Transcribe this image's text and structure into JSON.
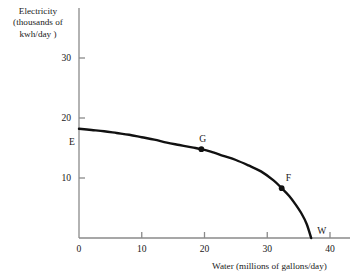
{
  "chart_data": {
    "type": "line",
    "title": "",
    "xlabel": "Water (millions of gallons/day)",
    "ylabel": "Electricity (thousands of kwh/day)",
    "ylabel_lines": [
      "Electricity",
      "(thousands of",
      "kwh/day )"
    ],
    "xlim": [
      0,
      42.6
    ],
    "ylim": [
      0,
      35.6
    ],
    "grid": false,
    "legend": "none",
    "xticks": [
      0,
      10,
      20,
      30,
      40
    ],
    "xtick_labels": [
      "0",
      "10",
      "20",
      "30",
      "40"
    ],
    "yticks": [
      10,
      20,
      30
    ],
    "ytick_labels": [
      "10",
      "20",
      "30"
    ],
    "series": [
      {
        "name": "production-possibilities-frontier",
        "x": [
          0,
          2,
          4,
          6,
          8,
          10,
          12,
          14,
          16,
          18,
          19.5,
          21,
          23,
          25,
          27,
          29,
          31,
          32.3,
          33.5,
          34.5,
          35.5,
          36.3,
          37
        ],
        "y": [
          18.2,
          18.0,
          17.8,
          17.5,
          17.2,
          16.8,
          16.4,
          15.9,
          15.5,
          15.1,
          14.8,
          14.4,
          13.7,
          13.0,
          12.1,
          11.1,
          9.6,
          8.3,
          7.0,
          5.6,
          4.0,
          2.3,
          0.0
        ]
      }
    ],
    "points": [
      {
        "label": "E",
        "x": 0,
        "y": 18.2,
        "marker": false,
        "label_dx": -10,
        "label_dy": 14
      },
      {
        "label": "G",
        "x": 19.5,
        "y": 14.8,
        "marker": true,
        "label_dx": -2,
        "label_dy": -9
      },
      {
        "label": "F",
        "x": 32.3,
        "y": 8.3,
        "marker": true,
        "label_dx": 4,
        "label_dy": -9
      },
      {
        "label": "W",
        "x": 37,
        "y": 0.0,
        "marker": false,
        "label_dx": 6,
        "label_dy": -6
      }
    ],
    "colors": {
      "curve": "#111111",
      "axis": "#8a8a8a",
      "text": "#1a1a1a",
      "background": "#ffffff"
    }
  }
}
